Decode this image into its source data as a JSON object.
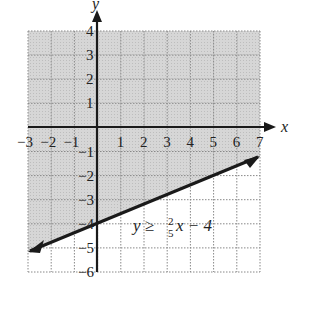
{
  "chart_data": {
    "type": "line",
    "title": "",
    "xlabel": "x",
    "ylabel": "y",
    "xlim": [
      -3,
      7
    ],
    "ylim": [
      -6,
      4
    ],
    "grid": true,
    "x_ticks": [
      "−3",
      "−2",
      "−1",
      "1",
      "2",
      "3",
      "4",
      "5",
      "6",
      "7"
    ],
    "y_ticks": [
      "4",
      "3",
      "2",
      "1",
      "−1",
      "−2",
      "−3",
      "−4",
      "−5",
      "−6"
    ],
    "series": [
      {
        "name": "boundary",
        "equation": "y = (2/5)x − 4",
        "style": "solid",
        "points": [
          [
            -3,
            -5.2
          ],
          [
            7,
            -1.2
          ]
        ]
      }
    ],
    "shaded_region": "above the line (y ≥ (2/5)x − 4)",
    "annotation": {
      "lhs": "y ≥ ",
      "frac_num": "2",
      "frac_den": "5",
      "rhs": "x − 4",
      "position": [
        2.5,
        -4
      ]
    }
  }
}
